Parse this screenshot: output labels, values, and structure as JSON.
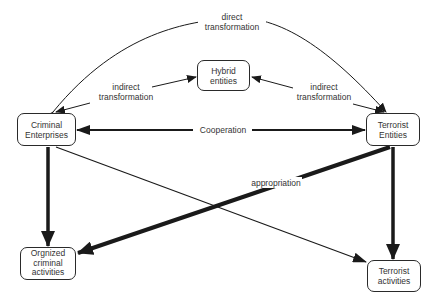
{
  "diagram": {
    "nodes": {
      "criminal_enterprises": {
        "label": "Criminal\nEnterprises"
      },
      "terrorist_entities": {
        "label": "Terrorist\nEntities"
      },
      "hybrid_entities": {
        "label": "Hybrid\nentities"
      },
      "organized_criminal_activities": {
        "label": "Orgnized\ncriminal\nactivities"
      },
      "terrorist_activities": {
        "label": "Terrorist\nactivities"
      }
    },
    "edge_labels": {
      "direct_transformation": "direct\ntransformation",
      "indirect_transformation_left": "indirect\ntransformation",
      "indirect_transformation_right": "indirect\ntransformation",
      "cooperation": "Cooperation",
      "appropriation": "appropriation"
    },
    "edges": [
      {
        "from": "Criminal Enterprises",
        "to": "Terrorist Entities",
        "label": "direct transformation",
        "style": "thin curved",
        "arrow": "both"
      },
      {
        "from": "Criminal Enterprises",
        "to": "Hybrid entities",
        "label": "indirect transformation",
        "style": "thin",
        "arrow": "both"
      },
      {
        "from": "Terrorist Entities",
        "to": "Hybrid entities",
        "label": "indirect transformation",
        "style": "thin",
        "arrow": "both"
      },
      {
        "from": "Criminal Enterprises",
        "to": "Terrorist Entities",
        "label": "Cooperation",
        "style": "medium",
        "arrow": "both"
      },
      {
        "from": "Criminal Enterprises",
        "to": "Orgnized criminal activities",
        "label": "",
        "style": "thick",
        "arrow": "end"
      },
      {
        "from": "Criminal Enterprises",
        "to": "Terrorist activities",
        "label": "",
        "style": "thin",
        "arrow": "end"
      },
      {
        "from": "Terrorist Entities",
        "to": "Terrorist activities",
        "label": "",
        "style": "thick",
        "arrow": "end"
      },
      {
        "from": "Terrorist Entities",
        "to": "Orgnized criminal activities",
        "label": "appropriation",
        "style": "thick",
        "arrow": "end"
      }
    ]
  }
}
